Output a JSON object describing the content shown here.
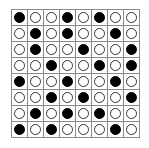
{
  "grid": {
    "rows": 8,
    "cols": 8,
    "colors": {
      "filled": "#000000",
      "empty": "#ffffff",
      "line": "#8a8a8a"
    },
    "cells": [
      [
        1,
        0,
        0,
        1,
        0,
        1,
        0,
        0
      ],
      [
        0,
        1,
        0,
        1,
        0,
        0,
        1,
        0
      ],
      [
        0,
        1,
        0,
        0,
        1,
        0,
        0,
        1
      ],
      [
        0,
        0,
        1,
        0,
        0,
        1,
        0,
        1
      ],
      [
        1,
        0,
        0,
        1,
        0,
        0,
        1,
        0
      ],
      [
        0,
        0,
        1,
        0,
        1,
        0,
        0,
        1
      ],
      [
        0,
        1,
        0,
        1,
        0,
        1,
        0,
        0
      ],
      [
        1,
        0,
        1,
        0,
        0,
        0,
        1,
        0
      ]
    ]
  }
}
